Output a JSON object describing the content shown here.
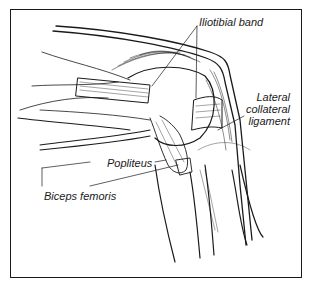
{
  "diagram": {
    "type": "anatomical-illustration",
    "labels": {
      "iliotibial_band": "Iliotibial band",
      "lateral_collateral_ligament": [
        "Lateral",
        "collateral",
        "ligament"
      ],
      "popliteus": "Popliteus",
      "biceps_femoris": "Biceps femoris"
    },
    "colors": {
      "ink": "#1a1a1a",
      "background": "#ffffff"
    }
  }
}
